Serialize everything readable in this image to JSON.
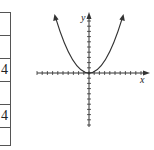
{
  "table": {
    "rows": [
      {
        "value": ""
      },
      {
        "value": ""
      },
      {
        "value": "4"
      },
      {
        "value": ""
      },
      {
        "value": "4"
      },
      {
        "value": ""
      }
    ]
  },
  "graph": {
    "x_label": "x",
    "y_label": "y",
    "curve": "parabola",
    "curve_description": "upward-opening parabola with vertex at origin",
    "x_ticks_each_side": 10,
    "y_ticks_each_side": 10
  },
  "colors": {
    "line": "#333333",
    "background": "#ffffff"
  }
}
